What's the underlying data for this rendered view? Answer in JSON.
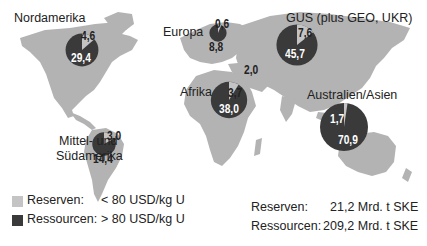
{
  "colors": {
    "land": "#b3b3b3",
    "reserves": "#c4c4c4",
    "resources": "#3a3a3a",
    "text": "#222222"
  },
  "chart_data": {
    "type": "pie",
    "title": "",
    "unit": "Mrd. t SKE",
    "regions": [
      {
        "name": "Nordamerika",
        "reserves": 4.6,
        "resources": 29.4,
        "reserves_label": "4,6",
        "resources_label": "29,4"
      },
      {
        "name": "Europa",
        "reserves": 0.6,
        "resources": 8.8,
        "reserves_label": "0,6",
        "resources_label": "8,8"
      },
      {
        "name": "GUS (plus GEO, UKR)",
        "reserves": 7.6,
        "resources": 45.7,
        "reserves_label": "7,6",
        "resources_label": "45,7"
      },
      {
        "name": "Afrika",
        "reserves": 3.7,
        "resources": 38.0,
        "reserves_label": "3,7",
        "resources_label": "38,0"
      },
      {
        "name": "Australien/Asien",
        "reserves": 1.7,
        "resources": 70.9,
        "reserves_label": "1,7",
        "resources_label": "70,9"
      },
      {
        "name": "Mittel- und Südamerika",
        "reserves": 3.0,
        "resources": 14.4,
        "reserves_label": "3,0",
        "resources_label": "14,4"
      }
    ],
    "middle_east_label": "2,0",
    "legend": [
      {
        "name": "Reserven:",
        "description": "< 80 USD/kg U"
      },
      {
        "name": "Ressourcen:",
        "description": "> 80 USD/kg U"
      }
    ],
    "totals": [
      {
        "name": "Reserven:",
        "value": "21,2 Mrd. t SKE"
      },
      {
        "name": "Ressourcen:",
        "value": "209,2 Mrd. t SKE"
      }
    ]
  },
  "labels": {
    "nordamerika": "Nordamerika",
    "europa": "Europa",
    "gus": "GUS (plus GEO, UKR)",
    "afrika": "Afrika",
    "australien": "Australien/Asien",
    "suedamerika_1": "Mittel- und",
    "suedamerika_2": "Südamerika"
  }
}
